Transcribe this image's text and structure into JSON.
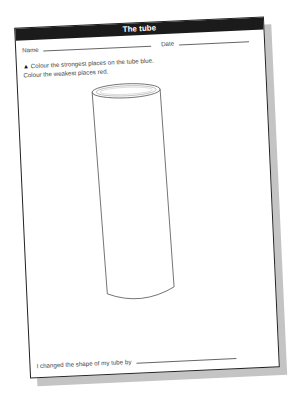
{
  "worksheet": {
    "title": "The tube",
    "name_label": "Name",
    "date_label": "Date",
    "instruction_marker": "▲",
    "instruction_1": "Colour the strongest places on the tube blue.",
    "instruction_2": "Colour the weakest places red.",
    "footer_prompt": "I changed the shape of my tube by",
    "illustration": "cylinder-tube"
  }
}
